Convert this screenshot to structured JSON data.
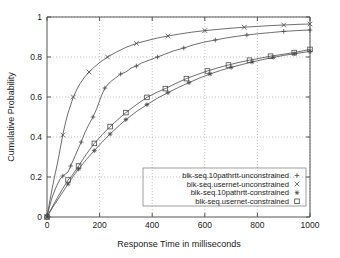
{
  "chart_data": {
    "type": "line",
    "title": "",
    "xlabel": "Response Time in milliseconds",
    "ylabel": "Cumulative Probability",
    "xlim": [
      0,
      1000
    ],
    "ylim": [
      0,
      1
    ],
    "xticks": [
      "0",
      "200",
      "400",
      "600",
      "800",
      "1000"
    ],
    "xtick_values": [
      0,
      200,
      400,
      600,
      800,
      1000
    ],
    "yticks": [
      "0",
      "0.2",
      "0.4",
      "0.6",
      "0.8",
      "1"
    ],
    "ytick_values": [
      0,
      0.2,
      0.4,
      0.6,
      0.8,
      1
    ],
    "grid": true,
    "legend_position": "lower right",
    "series": [
      {
        "name": "blk-seq.10pathrtt-unconstrained",
        "marker": "plus",
        "x": [
          0,
          10,
          20,
          30,
          40,
          50,
          60,
          70,
          80,
          90,
          100,
          115,
          130,
          145,
          160,
          175,
          190,
          205,
          220,
          240,
          260,
          280,
          300,
          320,
          340,
          360,
          390,
          420,
          450,
          480,
          520,
          560,
          600,
          640,
          680,
          720,
          760,
          800,
          850,
          900,
          950,
          1000
        ],
        "y": [
          0.0,
          0.055,
          0.1,
          0.135,
          0.165,
          0.19,
          0.205,
          0.215,
          0.225,
          0.255,
          0.285,
          0.33,
          0.375,
          0.425,
          0.465,
          0.5,
          0.545,
          0.6,
          0.645,
          0.675,
          0.695,
          0.715,
          0.725,
          0.745,
          0.755,
          0.77,
          0.785,
          0.8,
          0.815,
          0.83,
          0.845,
          0.862,
          0.875,
          0.885,
          0.895,
          0.903,
          0.91,
          0.916,
          0.922,
          0.928,
          0.932,
          0.935
        ]
      },
      {
        "name": "blk-seq.usernet-unconstrained",
        "marker": "cross",
        "x": [
          0,
          10,
          20,
          30,
          40,
          50,
          60,
          70,
          80,
          100,
          120,
          140,
          160,
          180,
          200,
          230,
          260,
          300,
          340,
          380,
          420,
          460,
          500,
          550,
          600,
          650,
          700,
          750,
          800,
          850,
          900,
          950,
          1000
        ],
        "y": [
          0.0,
          0.075,
          0.145,
          0.21,
          0.27,
          0.34,
          0.41,
          0.47,
          0.52,
          0.6,
          0.655,
          0.695,
          0.725,
          0.75,
          0.772,
          0.8,
          0.822,
          0.848,
          0.868,
          0.882,
          0.895,
          0.905,
          0.914,
          0.924,
          0.932,
          0.938,
          0.944,
          0.949,
          0.953,
          0.957,
          0.96,
          0.963,
          0.965
        ]
      },
      {
        "name": "blk-seq.10pathrtt-constrained",
        "marker": "star",
        "x": [
          0,
          20,
          40,
          60,
          80,
          100,
          120,
          150,
          180,
          210,
          240,
          270,
          300,
          340,
          380,
          420,
          460,
          500,
          540,
          580,
          620,
          660,
          700,
          740,
          780,
          820,
          860,
          900,
          940,
          1000
        ],
        "y": [
          0.0,
          0.045,
          0.085,
          0.125,
          0.165,
          0.205,
          0.24,
          0.288,
          0.332,
          0.375,
          0.415,
          0.452,
          0.487,
          0.527,
          0.562,
          0.594,
          0.622,
          0.648,
          0.672,
          0.695,
          0.715,
          0.733,
          0.748,
          0.762,
          0.775,
          0.787,
          0.798,
          0.808,
          0.816,
          0.828
        ]
      },
      {
        "name": "blk-seq.usernet-constrained",
        "marker": "square",
        "x": [
          0,
          20,
          40,
          60,
          80,
          95,
          120,
          150,
          180,
          210,
          240,
          270,
          300,
          340,
          380,
          420,
          450,
          490,
          530,
          570,
          610,
          650,
          690,
          730,
          770,
          810,
          850,
          890,
          940,
          1000
        ],
        "y": [
          0.0,
          0.05,
          0.098,
          0.142,
          0.185,
          0.207,
          0.255,
          0.315,
          0.368,
          0.412,
          0.452,
          0.488,
          0.522,
          0.562,
          0.598,
          0.625,
          0.642,
          0.668,
          0.692,
          0.712,
          0.73,
          0.746,
          0.76,
          0.773,
          0.784,
          0.794,
          0.804,
          0.812,
          0.822,
          0.838
        ]
      }
    ]
  },
  "legend": {
    "entries": [
      {
        "label": "blk-seq.10pathrtt-unconstrained",
        "marker": "plus"
      },
      {
        "label": "blk-seq.usernet-unconstrained",
        "marker": "cross"
      },
      {
        "label": "blk-seq.10pathrtt-constrained",
        "marker": "star"
      },
      {
        "label": "blk-seq.usernet-constrained",
        "marker": "square"
      }
    ]
  },
  "colors": {
    "line": "#4a4a4a",
    "axis": "#555555",
    "grid": "#999999",
    "text": "#1a1a1a",
    "background": "#ffffff"
  }
}
